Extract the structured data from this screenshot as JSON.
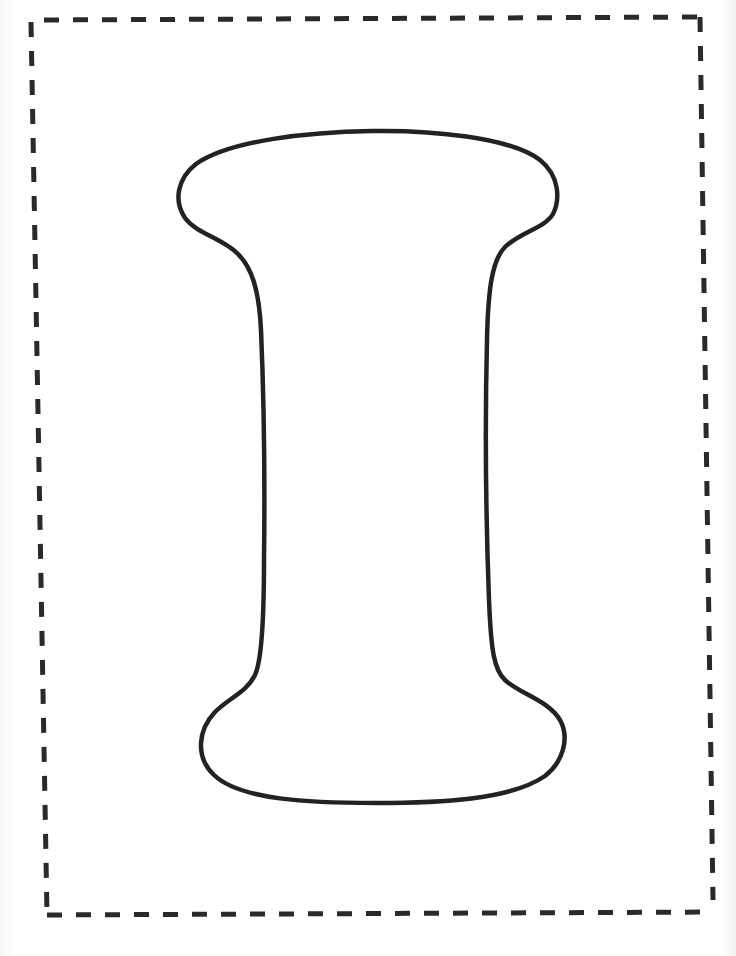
{
  "page": {
    "type": "printable coloring page",
    "letter": "I",
    "style": "bubble letter outline"
  },
  "colors": {
    "background": "#ffffff",
    "border": "#2a2a2a",
    "outline": "#222222"
  },
  "border": {
    "style": "dashed"
  }
}
